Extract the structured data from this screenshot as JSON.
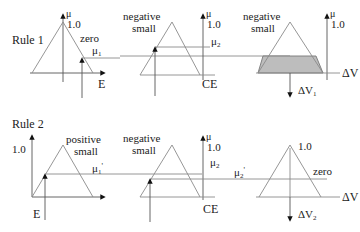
{
  "rules": [
    {
      "label": "Rule 1",
      "input1": {
        "set": "zero",
        "axis_label": "E",
        "mu_label": "μ",
        "peak_label": "1.0",
        "membership_label": "μ",
        "membership_sub": "1"
      },
      "input2": {
        "set_line1": "negative",
        "set_line2": "small",
        "axis_label": "CE",
        "mu_label": "μ",
        "peak_label": "1.0",
        "membership_label": "μ",
        "membership_sub": "2"
      },
      "output": {
        "set_line1": "negative",
        "set_line2": "small",
        "axis_label": "ΔV",
        "mu_label": "μ",
        "peak_label": "1.0",
        "result_label": "ΔV",
        "result_sub": "1"
      }
    },
    {
      "label": "Rule 2",
      "input1": {
        "set_line1": "positive",
        "set_line2": "small",
        "axis_label": "E",
        "peak_label": "1.0",
        "membership_label": "μ",
        "membership_sub": "1",
        "membership_prime": "'"
      },
      "input2": {
        "set_line1": "negative",
        "set_line2": "small",
        "axis_label": "CE",
        "mu_label": "μ",
        "peak_label": "1.0",
        "membership_label": "μ",
        "membership_sub": "2",
        "clipped_label": "μ",
        "clipped_sub": "2",
        "clipped_prime": "'"
      },
      "output": {
        "set": "zero",
        "axis_label": "ΔV",
        "peak_label": "1.0",
        "result_label": "ΔV",
        "result_sub": "2"
      }
    }
  ],
  "colors": {
    "line": "#8a8a8a",
    "axis": "#555555",
    "shade": "#bdbdbd",
    "text": "#222222"
  }
}
